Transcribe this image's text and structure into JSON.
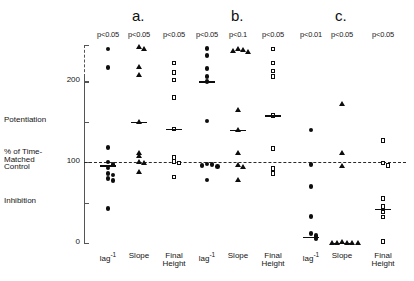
{
  "figure": {
    "yaxis": {
      "ticks": [
        {
          "label": "200",
          "value": 200
        },
        {
          "label": "",
          "value": 150
        },
        {
          "label": "100",
          "value": 100
        },
        {
          "label": "",
          "value": 50
        },
        {
          "label": "0",
          "value": 0
        }
      ],
      "side_labels": [
        {
          "text": "Potentiation",
          "value": 152
        },
        {
          "text": "% of Time-",
          "value": 112
        },
        {
          "text": "Matched",
          "value": 103
        },
        {
          "text": "Control",
          "value": 94
        },
        {
          "text": "Inhibition",
          "value": 52
        }
      ],
      "reference_line": 100,
      "range": [
        0,
        245
      ]
    },
    "panels": [
      {
        "letter": "a.",
        "pvalues": [
          "p<0.05",
          "p<0.05",
          "p<0.05"
        ]
      },
      {
        "letter": "b.",
        "pvalues": [
          "p<0.05",
          "p<0.1",
          "p<0.05"
        ]
      },
      {
        "letter": "c.",
        "pvalues": [
          "p<0.01",
          "p<0.05",
          "p<0.05"
        ]
      }
    ],
    "xlabels": [
      {
        "line1": "lag",
        "sup": "-1",
        "line2": ""
      },
      {
        "line1": "Slope",
        "sup": "",
        "line2": ""
      },
      {
        "line1": "Final",
        "sup": "",
        "line2": "Height"
      }
    ]
  },
  "chart_data": {
    "type": "scatter",
    "title": "",
    "xlabel": "",
    "ylabel": "% of Time-Matched Control",
    "ylim": [
      0,
      245
    ],
    "grid": false,
    "legend": "none",
    "reference_line": 100,
    "annotations": [
      "Potentiation",
      "Inhibition",
      "% of Time-Matched Control"
    ],
    "axis_tick_labels": [
      "0",
      "",
      "100",
      "",
      "200"
    ],
    "groups": [
      {
        "label": "a.",
        "columns": [
          {
            "name": "lag-1",
            "marker": "filled-circle",
            "pvalue": "p<0.05",
            "mean": 96,
            "values": [
              240,
              217,
              118,
              100,
              97,
              93,
              86,
              84,
              80,
              77,
              43
            ]
          },
          {
            "name": "Slope",
            "marker": "filled-triangle",
            "pvalue": "p<0.05",
            "mean": 150,
            "values": [
              243,
              241,
              218,
              208,
              150,
              112,
              108,
              101,
              99,
              88
            ]
          },
          {
            "name": "Final Height",
            "marker": "open-square",
            "pvalue": "p<0.05",
            "mean": 141,
            "values": [
              223,
              211,
              202,
              180,
              141,
              106,
              101,
              99,
              82
            ]
          }
        ]
      },
      {
        "label": "b.",
        "columns": [
          {
            "name": "lag-1",
            "marker": "filled-circle",
            "pvalue": "p<0.05",
            "mean": 200,
            "values": [
              241,
              232,
              216,
              206,
              200,
              151,
              98,
              97,
              96,
              95,
              78
            ]
          },
          {
            "name": "Slope",
            "marker": "filled-triangle",
            "pvalue": "p<0.1",
            "mean": 140,
            "values": [
              240,
              239,
              238,
              237,
              165,
              140,
              112,
              97,
              95,
              78
            ]
          },
          {
            "name": "Final Height",
            "marker": "open-square",
            "pvalue": "p<0.05",
            "mean": 158,
            "values": [
              240,
              223,
              213,
              206,
              158,
              117,
              92,
              86
            ]
          }
        ]
      },
      {
        "label": "c.",
        "columns": [
          {
            "name": "lag-1",
            "marker": "filled-circle",
            "pvalue": "p<0.01",
            "mean": 8,
            "values": [
              140,
              97,
              70,
              33,
              12,
              9,
              7,
              5
            ]
          },
          {
            "name": "Slope",
            "marker": "filled-triangle",
            "pvalue": "p<0.05",
            "mean": 0,
            "values": [
              172,
              112,
              96,
              2,
              1,
              1,
              0,
              0,
              0
            ]
          },
          {
            "name": "Final Height",
            "marker": "open-square",
            "pvalue": "p<0.05",
            "mean": 42,
            "values": [
              127,
              99,
              96,
              55,
              45,
              38,
              32,
              2
            ]
          }
        ]
      }
    ]
  }
}
